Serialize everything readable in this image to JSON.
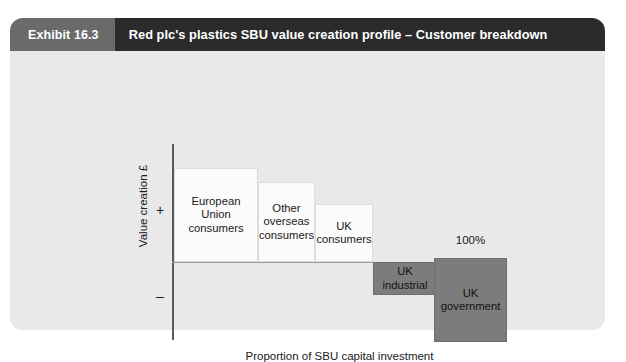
{
  "exhibit": {
    "number_label": "Exhibit 16.3",
    "title": "Red plc's plastics SBU value creation profile – Customer breakdown"
  },
  "axes": {
    "y_label": "Value creation £",
    "y_positive_sign": "+",
    "y_negative_sign": "–",
    "x_caption": "Proportion of SBU capital investment",
    "end_annotation": "100%"
  },
  "colors": {
    "card_background": "#e9e9e9",
    "exhibit_number_background": "#6a6a6a",
    "title_background": "#2b2b2b",
    "positive_bar": "#fbfbfb",
    "negative_bar": "#7c7c7c",
    "axis_line": "#5a5a5a",
    "text": "#1a1a1a"
  },
  "chart_data": {
    "type": "bar",
    "subtype": "value-creation-profile",
    "title": "Red plc's plastics SBU value creation profile – Customer breakdown",
    "xlabel": "Proportion of SBU capital investment",
    "ylabel": "Value creation £",
    "grid": false,
    "legend": "none",
    "xlim": [
      0,
      100
    ],
    "x_units": "cumulative % of SBU capital investment",
    "annotations": [
      "100%"
    ],
    "categories": [
      "European Union consumers",
      "Other overseas consumers",
      "UK consumers",
      "UK industrial",
      "UK government"
    ],
    "bars": [
      {
        "label": "European Union consumers",
        "label_lines": [
          "European",
          "Union",
          "consumers"
        ],
        "sign": "positive",
        "value_creation": 94,
        "capital_investment_share": 25,
        "cumulative_start": 0,
        "cumulative_end": 25,
        "fill": "#fbfbfb"
      },
      {
        "label": "Other overseas consumers",
        "label_lines": [
          "Other",
          "overseas",
          "consumers"
        ],
        "sign": "positive",
        "value_creation": 80,
        "capital_investment_share": 17,
        "cumulative_start": 25,
        "cumulative_end": 42,
        "fill": "#fbfbfb"
      },
      {
        "label": "UK consumers",
        "label_lines": [
          "UK",
          "consumers"
        ],
        "sign": "positive",
        "value_creation": 58,
        "capital_investment_share": 17,
        "cumulative_start": 42,
        "cumulative_end": 59,
        "fill": "#fbfbfb"
      },
      {
        "label": "UK industrial",
        "label_lines": [
          "UK",
          "industrial"
        ],
        "sign": "negative",
        "value_creation": -33,
        "capital_investment_share": 19,
        "cumulative_start": 59,
        "cumulative_end": 78,
        "fill": "#7c7c7c"
      },
      {
        "label": "UK government",
        "label_lines": [
          "UK",
          "government"
        ],
        "sign": "negative",
        "value_creation": -84,
        "capital_investment_share": 22,
        "cumulative_start": 78,
        "cumulative_end": 100,
        "fill": "#7c7c7c"
      }
    ]
  }
}
